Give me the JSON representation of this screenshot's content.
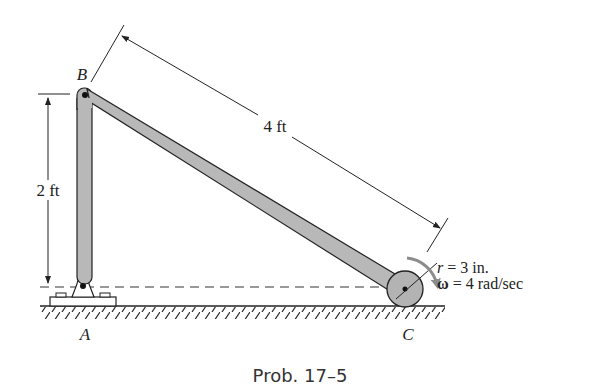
{
  "caption": "Prob. 17–5",
  "points": {
    "A": "A",
    "B": "B",
    "C": "C"
  },
  "dimensions": {
    "link_BC": "4 ft",
    "height_AB": "2 ft"
  },
  "wheel": {
    "radius_label": "r = 3 in.",
    "omega_symbol": "ω",
    "omega_label": " = 4 rad/sec"
  },
  "colors": {
    "link_fill": "#b8b8b8",
    "wheel_fill": "#b3b3b3",
    "line": "#222222",
    "arrow": "#8c8c8c"
  }
}
